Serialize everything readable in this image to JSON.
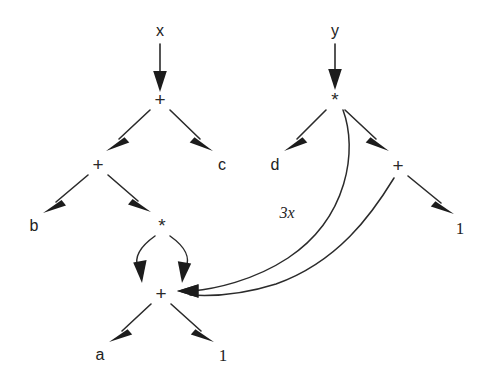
{
  "diagram": {
    "type": "directed-acyclic-graph",
    "background_color": "#ffffff",
    "stroke_color": "#2b2b2b",
    "arrow_color": "#1c1c1c",
    "nodes": [
      {
        "id": "x",
        "label": "x",
        "kind": "variable",
        "x": 160,
        "y": 31
      },
      {
        "id": "y",
        "label": "y",
        "kind": "variable",
        "x": 335,
        "y": 31
      },
      {
        "id": "plus1",
        "label": "+",
        "kind": "operator",
        "x": 160,
        "y": 99
      },
      {
        "id": "star1",
        "label": "*",
        "kind": "operator",
        "x": 335,
        "y": 99
      },
      {
        "id": "plus2",
        "label": "+",
        "kind": "operator",
        "x": 98,
        "y": 164
      },
      {
        "id": "c",
        "label": "c",
        "kind": "variable",
        "x": 222,
        "y": 165
      },
      {
        "id": "d",
        "label": "d",
        "kind": "variable",
        "x": 275,
        "y": 165
      },
      {
        "id": "plus3",
        "label": "+",
        "kind": "operator",
        "x": 398,
        "y": 165
      },
      {
        "id": "b",
        "label": "b",
        "kind": "variable",
        "x": 34,
        "y": 226
      },
      {
        "id": "star2",
        "label": "*",
        "kind": "operator",
        "x": 162,
        "y": 225
      },
      {
        "id": "one_r",
        "label": "1",
        "kind": "constant",
        "x": 460,
        "y": 228
      },
      {
        "id": "plus4",
        "label": "+",
        "kind": "operator",
        "x": 161,
        "y": 293
      },
      {
        "id": "a",
        "label": "a",
        "kind": "variable",
        "x": 100,
        "y": 355
      },
      {
        "id": "one_b",
        "label": "1",
        "kind": "constant",
        "x": 223,
        "y": 355
      }
    ],
    "edges": [
      {
        "id": "e1",
        "from": "x",
        "to": "plus1",
        "shape": "straight"
      },
      {
        "id": "e2",
        "from": "y",
        "to": "star1",
        "shape": "straight"
      },
      {
        "id": "e3",
        "from": "plus1",
        "to": "plus2",
        "shape": "straight"
      },
      {
        "id": "e4",
        "from": "plus1",
        "to": "c",
        "shape": "straight"
      },
      {
        "id": "e5",
        "from": "star1",
        "to": "d",
        "shape": "straight"
      },
      {
        "id": "e6",
        "from": "star1",
        "to": "plus3",
        "shape": "straight"
      },
      {
        "id": "e7",
        "from": "plus2",
        "to": "b",
        "shape": "straight"
      },
      {
        "id": "e8",
        "from": "plus2",
        "to": "star2",
        "shape": "straight"
      },
      {
        "id": "e9",
        "from": "plus3",
        "to": "one_r",
        "shape": "straight"
      },
      {
        "id": "e10",
        "from": "star2",
        "to": "plus4",
        "shape": "curved-left"
      },
      {
        "id": "e11",
        "from": "star2",
        "to": "plus4",
        "shape": "curved-right"
      },
      {
        "id": "e12",
        "from": "star1",
        "to": "plus4",
        "shape": "long-curve",
        "label": "3x"
      },
      {
        "id": "e13",
        "from": "plus3",
        "to": "plus4",
        "shape": "long-curve"
      },
      {
        "id": "e14",
        "from": "plus4",
        "to": "a",
        "shape": "straight"
      },
      {
        "id": "e15",
        "from": "plus4",
        "to": "one_b",
        "shape": "straight"
      }
    ],
    "edge_labels": [
      {
        "id": "lbl-3x",
        "text": "3x",
        "x": 287,
        "y": 213
      }
    ]
  }
}
